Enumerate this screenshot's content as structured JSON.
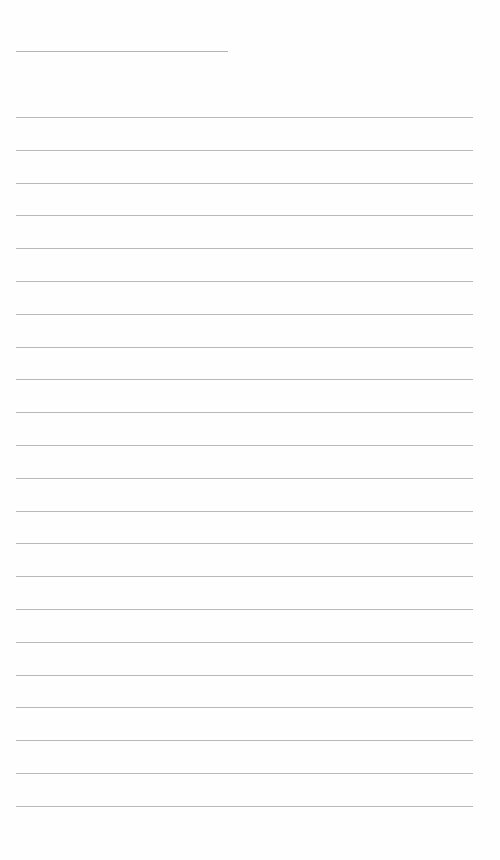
{
  "document": {
    "type": "lined-paper",
    "title_field": {
      "value": "",
      "line": {
        "left": 16,
        "top": 51,
        "width": 212
      }
    },
    "ruled_lines": {
      "count": 22,
      "left": 16,
      "width": 457,
      "first_top": 117,
      "spacing": 32.8,
      "color": "#b9b9b9"
    },
    "lines_text": [
      "",
      "",
      "",
      "",
      "",
      "",
      "",
      "",
      "",
      "",
      "",
      "",
      "",
      "",
      "",
      "",
      "",
      "",
      "",
      "",
      "",
      ""
    ]
  }
}
